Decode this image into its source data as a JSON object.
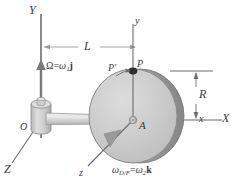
{
  "figure": {
    "background_color": "#ffffff",
    "line_color": "#3a3a3a",
    "disk_face_color": "#c9c9c9",
    "disk_rim_color": "#8f8f8f",
    "shaft_color": "#d8d8d8",
    "hub_color": "#c0c0c0"
  },
  "axes": {
    "Y_label": "Y",
    "X_label": "X",
    "Z_label": "Z",
    "y_label": "y",
    "x_label": "x",
    "z_label": "z"
  },
  "points": {
    "origin_label": "O",
    "center_label": "A",
    "p_label": "P",
    "p_prime_label": "P'"
  },
  "dimensions": {
    "length_label": "L",
    "radius_label": "R"
  },
  "vectors": {
    "frame_omega": {
      "symbol": "Ω",
      "equals": "=",
      "magnitude": "ω",
      "magnitude_subscript": "1",
      "unit": "j",
      "full_text": "Ω = ω₁j"
    },
    "disk_omega": {
      "symbol": "ω",
      "symbol_subscript": "D/F",
      "equals": "=",
      "magnitude": "ω",
      "magnitude_subscript": "2",
      "unit": "k",
      "full_text": "ω_D/F = ω₂k"
    }
  }
}
